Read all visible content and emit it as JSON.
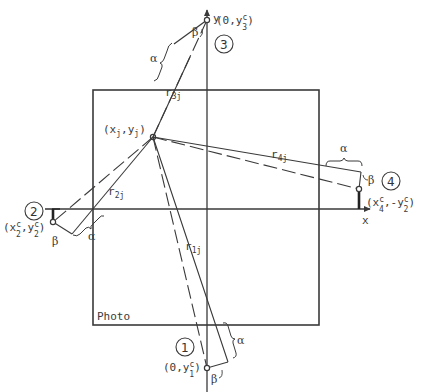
{
  "photo": {
    "label": "Photo"
  },
  "axes": {
    "x_label": "x",
    "y_label": "y"
  },
  "target_point": {
    "label_main": "(x",
    "label_sub1": "j",
    "label_mid": ",y",
    "label_sub2": "j",
    "label_end": ")"
  },
  "cameras": [
    {
      "number": "1",
      "coord_prefix": "(0,y",
      "coord_sup": "c",
      "coord_sub": "1",
      "coord_suffix": ")",
      "ray_label": "r",
      "ray_sub": "1j",
      "alpha": "α",
      "beta": "β"
    },
    {
      "number": "2",
      "coord_prefix": "(x",
      "coord_sup": "c",
      "coord_sub": "2",
      "coord_mid": ",y",
      "coord_sup2": "c",
      "coord_sub2": "2",
      "coord_suffix": ")",
      "ray_label": "r",
      "ray_sub": "2j",
      "alpha": "α",
      "beta": "β"
    },
    {
      "number": "3",
      "coord_prefix": "(0,y",
      "coord_sup": "c",
      "coord_sub": "3",
      "coord_suffix": ")",
      "ray_label": "r",
      "ray_sub": "3j",
      "alpha": "α",
      "beta": "β"
    },
    {
      "number": "4",
      "coord_prefix": "(x",
      "coord_sup": "c",
      "coord_sub": "4",
      "coord_mid": ",-y",
      "coord_sup2": "c",
      "coord_sub2": "2",
      "coord_suffix": ")",
      "ray_label": "r",
      "ray_sub": "4j",
      "alpha": "α",
      "beta": "β"
    }
  ],
  "colors": {
    "line": "#3a3a3a",
    "background": "#ffffff"
  }
}
